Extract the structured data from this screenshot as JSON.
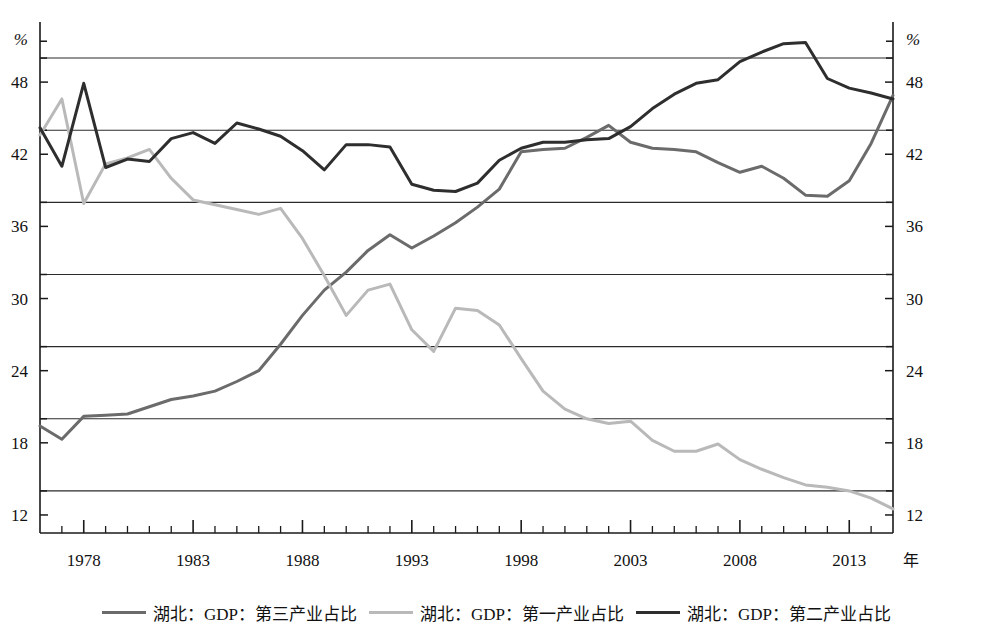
{
  "chart_data": {
    "type": "line",
    "title": "",
    "subtitle": "",
    "xlabel": "年",
    "ylabel": "%",
    "y_unit": "%",
    "xlim": [
      1976,
      2015
    ],
    "ylim": [
      10.5,
      52.5
    ],
    "yticks": [
      12,
      18,
      24,
      30,
      36,
      42,
      48
    ],
    "ytick_labels": [
      "12",
      "18",
      "24",
      "30",
      "36",
      "42",
      "48"
    ],
    "gridlines": [
      14,
      20,
      26,
      32,
      38,
      44,
      50
    ],
    "grid": true,
    "xticks": [
      1978,
      1983,
      1988,
      1993,
      1998,
      2003,
      2008,
      2013
    ],
    "xtick_labels": [
      "1978",
      "1983",
      "1988",
      "1993",
      "1998",
      "2003",
      "2008",
      "2013"
    ],
    "x_minor_tick_interval": 1,
    "legend_position": "bottom",
    "dual_y_axis": true,
    "x": [
      1976,
      1977,
      1978,
      1979,
      1980,
      1981,
      1982,
      1983,
      1984,
      1985,
      1986,
      1987,
      1988,
      1989,
      1990,
      1991,
      1992,
      1993,
      1994,
      1995,
      1996,
      1997,
      1998,
      1999,
      2000,
      2001,
      2002,
      2003,
      2004,
      2005,
      2006,
      2007,
      2008,
      2009,
      2010,
      2011,
      2012,
      2013,
      2014,
      2015
    ],
    "series": [
      {
        "name": "湖北：GDP：第三产业占比",
        "color": "#6b6b6b",
        "width": 3,
        "values": [
          19.4,
          18.3,
          20.2,
          20.3,
          20.4,
          21.0,
          21.6,
          21.9,
          22.3,
          23.1,
          24.0,
          26.2,
          28.6,
          30.7,
          32.2,
          34.0,
          35.3,
          34.2,
          35.2,
          36.3,
          37.6,
          39.1,
          42.2,
          42.4,
          42.5,
          43.4,
          44.4,
          43.0,
          42.5,
          42.4,
          42.2,
          41.3,
          40.5,
          41.0,
          40.0,
          38.6,
          38.5,
          39.8,
          42.9,
          46.9
        ]
      },
      {
        "name": "湖北：GDP：第一产业占比",
        "color": "#b9b9b9",
        "width": 3,
        "values": [
          43.6,
          46.6,
          37.9,
          41.2,
          41.7,
          42.4,
          40.0,
          38.2,
          37.8,
          37.4,
          37.0,
          37.5,
          35.0,
          31.9,
          28.6,
          30.7,
          31.2,
          27.4,
          25.6,
          29.2,
          29.0,
          27.8,
          25.0,
          22.3,
          20.8,
          20.0,
          19.6,
          19.8,
          18.2,
          17.3,
          17.3,
          17.9,
          16.6,
          15.8,
          15.1,
          14.5,
          14.3,
          14.0,
          13.4,
          12.5
        ]
      },
      {
        "name": "湖北：GDP：第二产业占比",
        "color": "#2e2e2e",
        "width": 3,
        "values": [
          44.2,
          41.0,
          47.9,
          40.9,
          41.6,
          41.4,
          43.3,
          43.8,
          42.9,
          44.6,
          44.1,
          43.5,
          42.3,
          40.7,
          42.8,
          42.8,
          42.6,
          39.5,
          39.0,
          38.9,
          39.6,
          41.5,
          42.5,
          43.0,
          43.0,
          43.2,
          43.3,
          44.3,
          45.8,
          47.0,
          47.9,
          48.2,
          49.7,
          50.5,
          51.2,
          51.3,
          48.3,
          47.5,
          47.1,
          46.6
        ]
      }
    ]
  },
  "axes": {
    "left_unit": "%",
    "right_unit": "%",
    "x_unit": "年"
  },
  "legend": {
    "items": [
      {
        "label": "湖北：GDP：第三产业占比",
        "color": "#6b6b6b"
      },
      {
        "label": "湖北：GDP：第一产业占比",
        "color": "#b9b9b9"
      },
      {
        "label": "湖北：GDP：第二产业占比",
        "color": "#2e2e2e"
      }
    ]
  }
}
